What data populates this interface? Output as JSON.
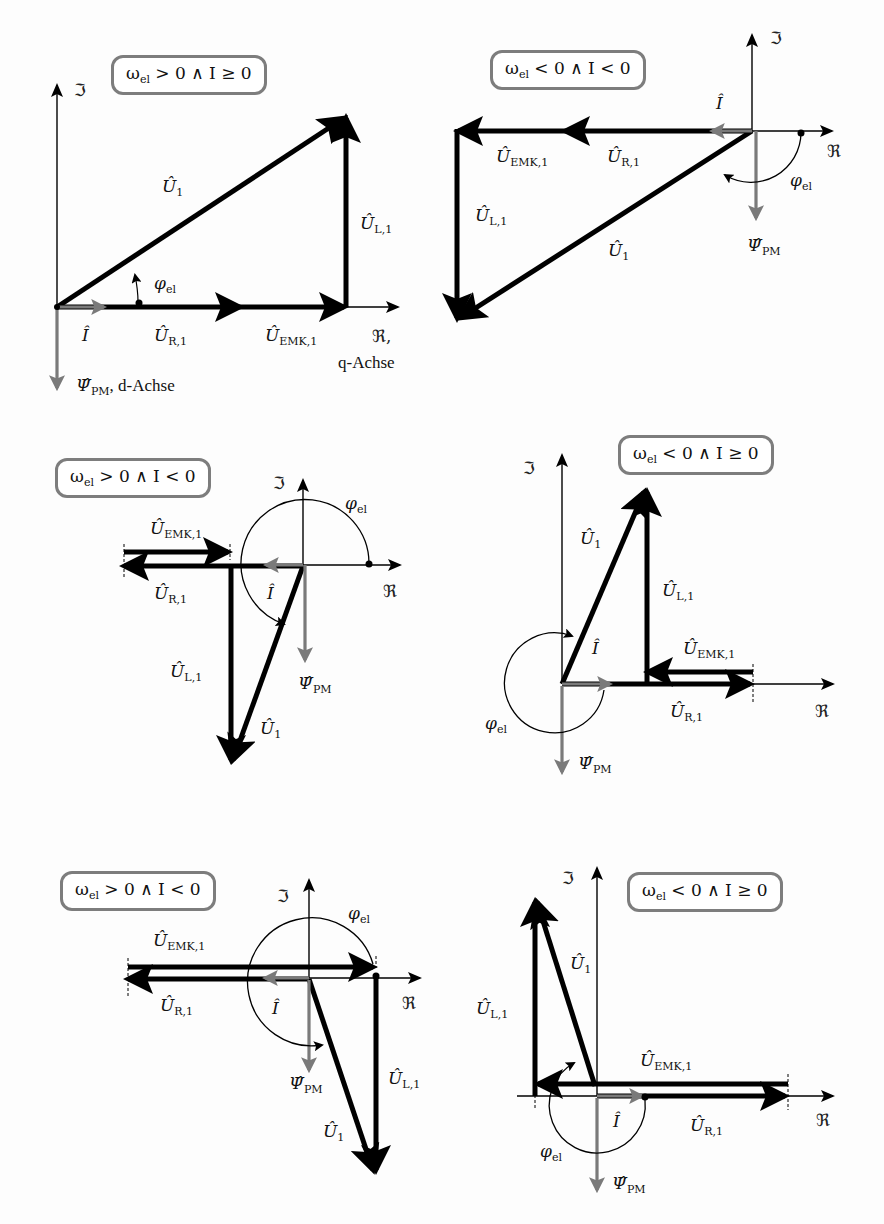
{
  "figure": {
    "type": "phasor-diagrams",
    "colors": {
      "voltage": "#000000",
      "current_flux": "#7a7a7a",
      "frame": "#7d7d7d",
      "axis": "#000000"
    },
    "symbols": {
      "imag_axis": "ℑ",
      "real_axis": "ℜ",
      "U1": "Û",
      "U1_sub": "1",
      "UL": "Û",
      "UL_sub": "L,1",
      "UR": "Û",
      "UR_sub": "R,1",
      "UEMK": "Û",
      "UEMK_sub": "EMK,1",
      "I": "Î",
      "Psi": "Ψ̂",
      "Psi_sub": "PM",
      "phi": "φ",
      "phi_sub": "el"
    },
    "panels": [
      {
        "id": "p1",
        "condition": "ωel > 0 ∧ I ≥ 0",
        "condition_parts": [
          "ω",
          "el",
          " > 0 ∧ I ≥ 0"
        ],
        "real_axis_suffix": ",",
        "real_axis_extra": "q-Achse",
        "psi_suffix": ", d-Achse"
      },
      {
        "id": "p2",
        "condition": "ωel < 0 ∧ I < 0",
        "condition_parts": [
          "ω",
          "el",
          " < 0 ∧ I < 0"
        ]
      },
      {
        "id": "p3",
        "condition": "ωel > 0 ∧ I < 0",
        "condition_parts": [
          "ω",
          "el",
          " > 0 ∧ I < 0"
        ]
      },
      {
        "id": "p4",
        "condition": "ωel < 0 ∧ I ≥ 0",
        "condition_parts": [
          "ω",
          "el",
          " < 0 ∧ I ≥ 0"
        ]
      },
      {
        "id": "p5",
        "condition": "ωel > 0 ∧ I < 0",
        "condition_parts": [
          "ω",
          "el",
          " > 0 ∧ I < 0"
        ]
      },
      {
        "id": "p6",
        "condition": "ωel < 0 ∧ I ≥ 0",
        "condition_parts": [
          "ω",
          "el",
          " < 0 ∧ I ≥ 0"
        ]
      }
    ]
  }
}
